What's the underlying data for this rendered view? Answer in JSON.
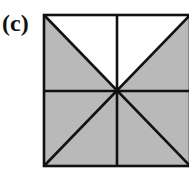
{
  "figure": {
    "label": "(c)",
    "shade_color": "#b8b8b8",
    "line_color": "#111111"
  }
}
